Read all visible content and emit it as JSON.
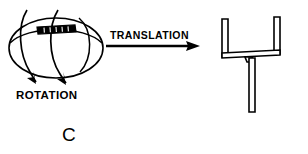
{
  "figure": {
    "panel_label": "C",
    "labels": {
      "rotation": "ROTATION",
      "translation": "TRANSLATION"
    },
    "colors": {
      "ink": "#000000",
      "background": "#ffffff"
    },
    "elements": {
      "left_object_name": "rotating-ellipsoid",
      "right_object_name": "goalpost-shape",
      "arrow_name": "translation-arrow"
    }
  }
}
